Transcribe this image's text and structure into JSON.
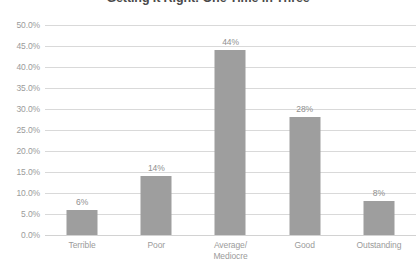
{
  "chart_data": {
    "type": "bar",
    "title": "Getting It Right: One Time in Three",
    "xlabel": "",
    "ylabel": "",
    "categories": [
      "Terrible",
      "Poor",
      "Average/\nMediocre",
      "Good",
      "Outstanding"
    ],
    "category_lines": [
      [
        "Terrible"
      ],
      [
        "Poor"
      ],
      [
        "Average/",
        "Mediocre"
      ],
      [
        "Good"
      ],
      [
        "Outstanding"
      ]
    ],
    "values": [
      6,
      14,
      44,
      28,
      8
    ],
    "data_labels": [
      "6%",
      "14%",
      "44%",
      "28%",
      "8%"
    ],
    "ylim": [
      0,
      50
    ],
    "ytick_values": [
      50,
      45,
      40,
      35,
      30,
      25,
      20,
      15,
      10,
      5,
      0
    ],
    "ytick_labels": [
      "50.0%",
      "45.0%",
      "40.0%",
      "35.0%",
      "30.0%",
      "25.0%",
      "20.0%",
      "15.0%",
      "10.0%",
      "5.0%",
      "0.0%"
    ],
    "grid": "horizontal",
    "legend": "none",
    "colors": {
      "bar": "#9e9e9e",
      "gridline": "#d9d9d9",
      "axis_text": "#9b9b9b",
      "label_text": "#8f8f8f",
      "title_text": "#4a4a4a",
      "background": "#ffffff"
    }
  }
}
